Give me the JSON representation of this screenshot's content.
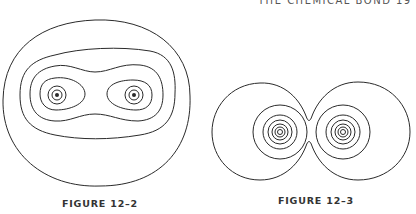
{
  "header": {
    "running_title": "THE CHEMICAL BOND",
    "page_number": "19"
  },
  "figures": [
    {
      "caption": "FIGURE 12–2",
      "description": "Contour diagram of electron density around two nuclei enclosed in a single large boundary; nested contours merge into a peanut shape"
    },
    {
      "caption": "FIGURE 12–3",
      "description": "Contour diagram of two separate atoms' electron density with concentric circles around each nucleus, outer contours pinched at the middle"
    }
  ],
  "colors": {
    "ink": "#2a2a2a",
    "background": "#ffffff"
  }
}
